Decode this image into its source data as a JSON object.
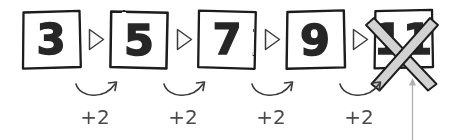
{
  "diagram": {
    "title": "Arithmetic sequence with step +2, last term rejected",
    "background_color": "#ffffff",
    "ink_color": "#1a1a1a",
    "digit_color": "#262626",
    "step_label_color": "#4a4a4a",
    "connector_color": "#3a3a3a",
    "cross_fill_color": "#d2d2d2",
    "cross_stroke_color": "#1f1f1f",
    "pointer_color": "#b0b0b0",
    "boxes": [
      {
        "id": "box-1",
        "value": "3",
        "crossed_out": false,
        "x": 22,
        "y": 10,
        "width": 58,
        "height": 58
      },
      {
        "id": "box-2",
        "value": "5",
        "crossed_out": false,
        "x": 110,
        "y": 10,
        "width": 58,
        "height": 58
      },
      {
        "id": "box-3",
        "value": "7",
        "crossed_out": false,
        "x": 198,
        "y": 10,
        "width": 58,
        "height": 58
      },
      {
        "id": "box-4",
        "value": "9",
        "crossed_out": false,
        "x": 286,
        "y": 10,
        "width": 58,
        "height": 58
      },
      {
        "id": "box-5",
        "value": "11",
        "crossed_out": true,
        "x": 374,
        "y": 10,
        "width": 58,
        "height": 58
      }
    ],
    "connectors": [
      {
        "id": "connector-1",
        "glyph": "triangle-right",
        "x": 94
      },
      {
        "id": "connector-2",
        "glyph": "triangle-right",
        "x": 182
      },
      {
        "id": "connector-3",
        "glyph": "triangle-right",
        "x": 270
      },
      {
        "id": "connector-4",
        "glyph": "triangle-right",
        "x": 358
      }
    ],
    "steps": [
      {
        "id": "step-1",
        "label": "+2",
        "x": 95,
        "y": 118
      },
      {
        "id": "step-2",
        "label": "+2",
        "x": 183,
        "y": 118
      },
      {
        "id": "step-3",
        "label": "+2",
        "x": 271,
        "y": 118
      },
      {
        "id": "step-4",
        "label": "+2",
        "x": 359,
        "y": 118
      }
    ],
    "pointer": {
      "id": "pointer-to-crossed-box",
      "x": 412,
      "top_y": 78,
      "bottom_y": 140
    }
  }
}
